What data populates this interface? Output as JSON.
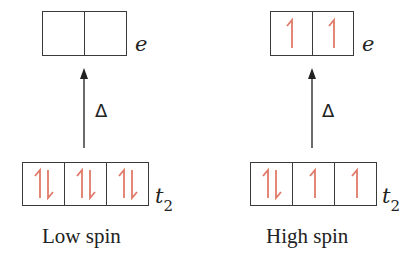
{
  "diagram": {
    "colors": {
      "electron": "#e07a68",
      "line": "#3a3a3a",
      "text": "#222222"
    },
    "panels": [
      {
        "caption": "Low spin",
        "delta_label": "Δ",
        "upper_level": {
          "label": "e",
          "orbitals": [
            "empty",
            "empty"
          ]
        },
        "lower_level": {
          "label": "t",
          "subscript": "2",
          "orbitals": [
            "paired",
            "paired",
            "paired"
          ]
        }
      },
      {
        "caption": "High spin",
        "delta_label": "Δ",
        "upper_level": {
          "label": "e",
          "orbitals": [
            "up",
            "up"
          ]
        },
        "lower_level": {
          "label": "t",
          "subscript": "2",
          "orbitals": [
            "paired",
            "up",
            "up"
          ]
        }
      }
    ]
  }
}
